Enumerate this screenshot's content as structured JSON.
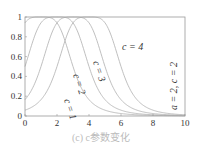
{
  "chart_data": {
    "type": "line",
    "title": "",
    "caption": "(c) c参数变化",
    "xlabel": "",
    "ylabel": "",
    "xlim": [
      0,
      10
    ],
    "ylim": [
      0,
      1
    ],
    "x_ticks": [
      "0",
      "2",
      "4",
      "6",
      "8",
      "10"
    ],
    "y_ticks": [
      "0",
      "0.2",
      "0.4",
      "0.6",
      "0.8",
      "1"
    ],
    "grid": false,
    "function": "1/(1+|(x-c)/a|^(2b))",
    "params_label": "a = 2, c = 2",
    "series": [
      {
        "name": "c = 1",
        "center": 1,
        "x": [
          0,
          1,
          2,
          3,
          4,
          5,
          6,
          7,
          8,
          9,
          10
        ],
        "values": [
          0.94,
          1.0,
          0.94,
          0.5,
          0.165,
          0.059,
          0.024,
          0.011,
          0.006,
          0.004,
          0.002
        ]
      },
      {
        "name": "c = 2",
        "center": 2,
        "x": [
          0,
          1,
          2,
          3,
          4,
          5,
          6,
          7,
          8,
          9,
          10
        ],
        "values": [
          0.5,
          0.94,
          1.0,
          0.94,
          0.5,
          0.165,
          0.059,
          0.024,
          0.011,
          0.006,
          0.004
        ]
      },
      {
        "name": "c = 3",
        "center": 3,
        "x": [
          0,
          1,
          2,
          3,
          4,
          5,
          6,
          7,
          8,
          9,
          10
        ],
        "values": [
          0.165,
          0.5,
          0.94,
          1.0,
          0.94,
          0.5,
          0.165,
          0.059,
          0.024,
          0.011,
          0.006
        ]
      },
      {
        "name": "c = 4",
        "center": 4,
        "x": [
          0,
          1,
          2,
          3,
          4,
          5,
          6,
          7,
          8,
          9,
          10
        ],
        "values": [
          0.059,
          0.165,
          0.5,
          0.94,
          1.0,
          0.94,
          0.5,
          0.165,
          0.059,
          0.024,
          0.011
        ]
      }
    ],
    "annotations": [
      "c = 1",
      "c = 2",
      "c = 3",
      "c = 4",
      "a = 2, c = 2"
    ]
  },
  "colors": {
    "curve": "#b8b8b8",
    "axis": "#999999",
    "text": "#333333",
    "caption": "#bbbbbb"
  }
}
